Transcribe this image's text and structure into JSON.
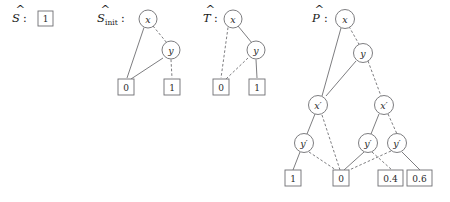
{
  "figure": {
    "type": "decision-diagram-group",
    "background": "#ffffff",
    "line_color": "#6e6e72",
    "text_color": "#1a1a1a"
  },
  "groups": [
    {
      "id": "S",
      "label": "S",
      "label_accent": "hat",
      "subscript": "",
      "colon": ":",
      "nodes": [],
      "leaves": [
        {
          "id": "S_leaf_1",
          "value": "1"
        }
      ],
      "edges": []
    },
    {
      "id": "S_init",
      "label": "S",
      "label_accent": "hat",
      "subscript": "init",
      "colon": ":",
      "nodes": [
        {
          "id": "Sinit_x",
          "label": "x"
        },
        {
          "id": "Sinit_y",
          "label": "y"
        }
      ],
      "leaves": [
        {
          "id": "Sinit_leaf_0",
          "value": "0"
        },
        {
          "id": "Sinit_leaf_1",
          "value": "1"
        }
      ],
      "edges": [
        {
          "from": "Sinit_x",
          "to": "Sinit_leaf_0",
          "style": "solid"
        },
        {
          "from": "Sinit_x",
          "to": "Sinit_y",
          "style": "dashed"
        },
        {
          "from": "Sinit_y",
          "to": "Sinit_leaf_0",
          "style": "solid"
        },
        {
          "from": "Sinit_y",
          "to": "Sinit_leaf_1",
          "style": "dashed"
        }
      ]
    },
    {
      "id": "T",
      "label": "T",
      "label_accent": "hat",
      "subscript": "",
      "colon": ":",
      "nodes": [
        {
          "id": "T_x",
          "label": "x"
        },
        {
          "id": "T_y",
          "label": "y"
        }
      ],
      "leaves": [
        {
          "id": "T_leaf_0",
          "value": "0"
        },
        {
          "id": "T_leaf_1",
          "value": "1"
        }
      ],
      "edges": [
        {
          "from": "T_x",
          "to": "T_leaf_0",
          "style": "dashed"
        },
        {
          "from": "T_x",
          "to": "T_y",
          "style": "solid"
        },
        {
          "from": "T_y",
          "to": "T_leaf_0",
          "style": "dashed"
        },
        {
          "from": "T_y",
          "to": "T_leaf_1",
          "style": "solid"
        }
      ]
    },
    {
      "id": "P",
      "label": "P",
      "label_accent": "hat",
      "subscript": "",
      "colon": ":",
      "nodes": [
        {
          "id": "P_x",
          "label": "x"
        },
        {
          "id": "P_y",
          "label": "y"
        },
        {
          "id": "P_xp_left",
          "label": "x′"
        },
        {
          "id": "P_xp_right",
          "label": "x′"
        },
        {
          "id": "P_yp_left",
          "label": "y′"
        },
        {
          "id": "P_yp_mid",
          "label": "y′"
        },
        {
          "id": "P_yp_right",
          "label": "y′"
        }
      ],
      "leaves": [
        {
          "id": "P_leaf_1",
          "value": "1"
        },
        {
          "id": "P_leaf_0",
          "value": "0"
        },
        {
          "id": "P_leaf_04",
          "value": "0.4"
        },
        {
          "id": "P_leaf_06",
          "value": "0.6"
        }
      ],
      "edges": [
        {
          "from": "P_x",
          "to": "P_xp_left",
          "style": "solid"
        },
        {
          "from": "P_x",
          "to": "P_y",
          "style": "dashed"
        },
        {
          "from": "P_y",
          "to": "P_xp_left",
          "style": "solid"
        },
        {
          "from": "P_y",
          "to": "P_xp_right",
          "style": "dashed"
        },
        {
          "from": "P_xp_left",
          "to": "P_yp_left",
          "style": "solid"
        },
        {
          "from": "P_xp_left",
          "to": "P_leaf_0",
          "style": "dashed"
        },
        {
          "from": "P_xp_right",
          "to": "P_yp_mid",
          "style": "solid"
        },
        {
          "from": "P_xp_right",
          "to": "P_yp_right",
          "style": "dashed"
        },
        {
          "from": "P_yp_left",
          "to": "P_leaf_1",
          "style": "solid"
        },
        {
          "from": "P_yp_left",
          "to": "P_leaf_0",
          "style": "dashed"
        },
        {
          "from": "P_yp_mid",
          "to": "P_leaf_0",
          "style": "solid"
        },
        {
          "from": "P_yp_mid",
          "to": "P_leaf_04",
          "style": "dashed"
        },
        {
          "from": "P_yp_right",
          "to": "P_leaf_0",
          "style": "dashed"
        },
        {
          "from": "P_yp_right",
          "to": "P_leaf_06",
          "style": "solid"
        }
      ]
    }
  ]
}
